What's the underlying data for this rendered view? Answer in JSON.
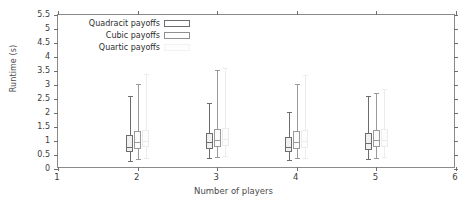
{
  "chart_data": {
    "type": "box",
    "title": "",
    "xlabel": "Number of players",
    "ylabel": "Runtime (s)",
    "xlim": [
      1,
      6
    ],
    "ylim": [
      0,
      5.5
    ],
    "ytick_labels": [
      "0",
      "0.5",
      "1",
      "1.5",
      "2",
      "2.5",
      "3",
      "3.5",
      "4",
      "4.5",
      "5",
      "5.5"
    ],
    "ytick_values": [
      0,
      0.5,
      1,
      1.5,
      2,
      2.5,
      3,
      3.5,
      4,
      4.5,
      5,
      5.5
    ],
    "xtick_labels": [
      "1",
      "2",
      "3",
      "4",
      "5",
      "6"
    ],
    "xtick_values": [
      1,
      2,
      3,
      4,
      5,
      6
    ],
    "grid": false,
    "legend_position": "upper left",
    "legend": [
      {
        "label": "Quadracit payoffs",
        "swatch": "sw1",
        "color": "#6d6d6d"
      },
      {
        "label": "Cubic payoffs",
        "swatch": "sw2",
        "color": "#8f8f8f"
      },
      {
        "label": "Quartic payoffs",
        "swatch": "sw3",
        "color": "#f2f2f2"
      }
    ],
    "groups": [
      {
        "x": 2,
        "boxes": [
          {
            "series": "Quadracit payoffs",
            "offset": -0.1,
            "q1": 0.62,
            "median": 0.8,
            "q3": 1.22,
            "whisker_low": 0.3,
            "whisker_high": 2.62,
            "color": "#6d6d6d",
            "fill": "#f0f0f0"
          },
          {
            "series": "Cubic payoffs",
            "offset": 0.0,
            "q1": 0.72,
            "median": 0.95,
            "q3": 1.35,
            "whisker_low": 0.35,
            "whisker_high": 3.05,
            "color": "#9a9a9a",
            "fill": "#fbfbfb"
          },
          {
            "series": "Quartic payoffs",
            "offset": 0.1,
            "q1": 0.78,
            "median": 1.0,
            "q3": 1.4,
            "whisker_low": 0.38,
            "whisker_high": 3.4,
            "color": "#ececec",
            "fill": "#fdfdfd"
          }
        ]
      },
      {
        "x": 3,
        "boxes": [
          {
            "series": "Quadracit payoffs",
            "offset": -0.1,
            "q1": 0.7,
            "median": 0.95,
            "q3": 1.3,
            "whisker_low": 0.38,
            "whisker_high": 2.35,
            "color": "#6d6d6d",
            "fill": "#f0f0f0"
          },
          {
            "series": "Cubic payoffs",
            "offset": 0.0,
            "q1": 0.8,
            "median": 1.05,
            "q3": 1.42,
            "whisker_low": 0.42,
            "whisker_high": 3.55,
            "color": "#9a9a9a",
            "fill": "#fbfbfb"
          },
          {
            "series": "Quartic payoffs",
            "offset": 0.1,
            "q1": 0.82,
            "median": 1.08,
            "q3": 1.45,
            "whisker_low": 0.45,
            "whisker_high": 3.6,
            "color": "#ececec",
            "fill": "#fdfdfd"
          }
        ]
      },
      {
        "x": 4,
        "boxes": [
          {
            "series": "Quadracit payoffs",
            "offset": -0.1,
            "q1": 0.62,
            "median": 0.8,
            "q3": 1.15,
            "whisker_low": 0.32,
            "whisker_high": 2.05,
            "color": "#6d6d6d",
            "fill": "#f0f0f0"
          },
          {
            "series": "Cubic payoffs",
            "offset": 0.0,
            "q1": 0.72,
            "median": 0.98,
            "q3": 1.35,
            "whisker_low": 0.38,
            "whisker_high": 3.05,
            "color": "#9a9a9a",
            "fill": "#fbfbfb"
          },
          {
            "series": "Quartic payoffs",
            "offset": 0.1,
            "q1": 0.75,
            "median": 1.0,
            "q3": 1.38,
            "whisker_low": 0.4,
            "whisker_high": 3.35,
            "color": "#ececec",
            "fill": "#fdfdfd"
          }
        ]
      },
      {
        "x": 5,
        "boxes": [
          {
            "series": "Quadracit payoffs",
            "offset": -0.1,
            "q1": 0.68,
            "median": 0.92,
            "q3": 1.28,
            "whisker_low": 0.35,
            "whisker_high": 2.62,
            "color": "#6d6d6d",
            "fill": "#f0f0f0"
          },
          {
            "series": "Cubic payoffs",
            "offset": 0.0,
            "q1": 0.78,
            "median": 1.02,
            "q3": 1.4,
            "whisker_low": 0.4,
            "whisker_high": 2.72,
            "color": "#9a9a9a",
            "fill": "#fbfbfb"
          },
          {
            "series": "Quartic payoffs",
            "offset": 0.1,
            "q1": 0.8,
            "median": 1.05,
            "q3": 1.42,
            "whisker_low": 0.42,
            "whisker_high": 2.85,
            "color": "#ececec",
            "fill": "#fdfdfd"
          }
        ]
      }
    ]
  }
}
